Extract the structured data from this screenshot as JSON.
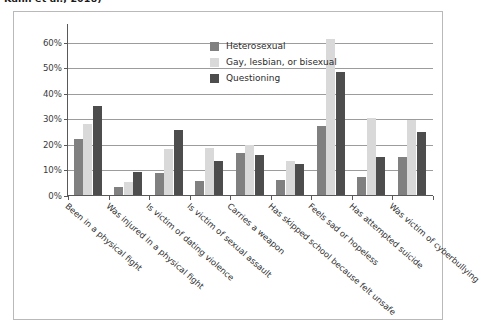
{
  "caption": {
    "text": "Kann et al., 2016)"
  },
  "legend": {
    "position": "top-center-inside",
    "items": [
      {
        "label": "Heterosexual",
        "color": "#808080"
      },
      {
        "label": "Gay, lesbian, or bisexual",
        "color": "#d9d9d9"
      },
      {
        "label": "Questioning",
        "color": "#4d4d4d"
      }
    ]
  },
  "chart_data": {
    "type": "bar",
    "title": "",
    "subtitle": "",
    "xlabel": "",
    "ylabel": "",
    "ylim": [
      0,
      65
    ],
    "grid": true,
    "y_ticks": [
      0,
      10,
      20,
      30,
      40,
      50,
      60
    ],
    "y_tick_labels": [
      "0%",
      "10%",
      "20%",
      "30%",
      "40%",
      "50%",
      "60%"
    ],
    "legend_position": "upper center",
    "categories": [
      "Been in a physical fight",
      "Was injured in a physical fight",
      "Is victim of dating violence",
      "Is victim of sexual assault",
      "Carries a weapon",
      "Has skipped school because felt unsafe",
      "Feels sad or hopeless",
      "Has attempted suicide",
      "Was victim of cyberbullying"
    ],
    "series": [
      {
        "name": "Heterosexual",
        "color": "#808080",
        "values": [
          22,
          3,
          8.5,
          5.5,
          16.5,
          6,
          27,
          7,
          15
        ]
      },
      {
        "name": "Gay, lesbian, or bisexual",
        "color": "#d9d9d9",
        "values": [
          28,
          5,
          18,
          18.5,
          19.5,
          13.5,
          61,
          30,
          29.5
        ]
      },
      {
        "name": "Questioning",
        "color": "#4d4d4d",
        "values": [
          35,
          9,
          25.5,
          13.5,
          15.5,
          12,
          48,
          15,
          24.5
        ]
      }
    ]
  }
}
